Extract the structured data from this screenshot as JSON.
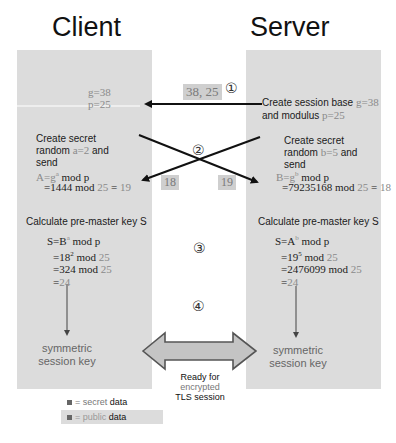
{
  "titles": {
    "client": "Client",
    "server": "Server"
  },
  "steps": {
    "s1": "①",
    "s2": "②",
    "s3": "③",
    "s4": "④"
  },
  "client": {
    "g_line": "g=38",
    "p_line": "p=25",
    "create_l1": "Create secret",
    "create_l2_pre": "random ",
    "create_l2_val": "a=2",
    "create_l2_post": " and",
    "create_l3": "send",
    "A_formula_pre": "A=g",
    "A_formula_sup": "a",
    "A_formula_post": " mod p",
    "A_calc_a": "=1444",
    "A_calc_b": " mod ",
    "A_calc_c": "25",
    "A_calc_d": " = ",
    "A_calc_e": "19",
    "calc_title": "Calculate pre-master key S",
    "S_formula_pre": "S=B",
    "S_formula_sup": "a",
    "S_formula_post": " mod p",
    "S_l2_a": "=18",
    "S_l2_sup": "2",
    "S_l2_b": " mod ",
    "S_l2_c": "25",
    "S_l3_a": "=324",
    "S_l3_b": " mod ",
    "S_l3_c": "25",
    "S_l4_a": "=",
    "S_l4_b": "24",
    "key_l1": "symmetric",
    "key_l2": "session key"
  },
  "server": {
    "create_base_pre": "Create session base ",
    "create_base_val": "g=38",
    "modulus_pre": "and modulus ",
    "modulus_val": "p=25",
    "create_l1": "Create secret",
    "create_l2_pre": "random ",
    "create_l2_val": "b=5",
    "create_l2_post": " and",
    "create_l3": "send",
    "B_formula_pre": "B=g",
    "B_formula_sup": "b",
    "B_formula_post": " mod p",
    "B_calc_a": "=79235168",
    "B_calc_b": " mod ",
    "B_calc_c": "25",
    "B_calc_d": " = ",
    "B_calc_e": "18",
    "calc_title": "Calculate pre-master key S",
    "S_formula_pre": "S=A",
    "S_formula_sup": "b",
    "S_formula_post": " mod p",
    "S_l2_a": "=19",
    "S_l2_sup": "5",
    "S_l2_b": " mod ",
    "S_l2_c": "25",
    "S_l3_a": "=2476099",
    "S_l3_b": " mod ",
    "S_l3_c": "25",
    "S_l4_a": "=",
    "S_l4_b": "24",
    "key_l1": "symmetric",
    "key_l2": "session key"
  },
  "messages": {
    "m1": "38, 25",
    "m2_left": "18",
    "m2_right": "19"
  },
  "ready": {
    "l1": "Ready for",
    "l2": "encrypted",
    "l3": "TLS session"
  },
  "legend": {
    "secret_eq": "= secret ",
    "secret_data": "data",
    "public_eq": "= public ",
    "public_data": "data"
  },
  "colors": {
    "panel": "#dcdcdc",
    "public_text": "#8a8a8a",
    "arrow": "#111111"
  }
}
